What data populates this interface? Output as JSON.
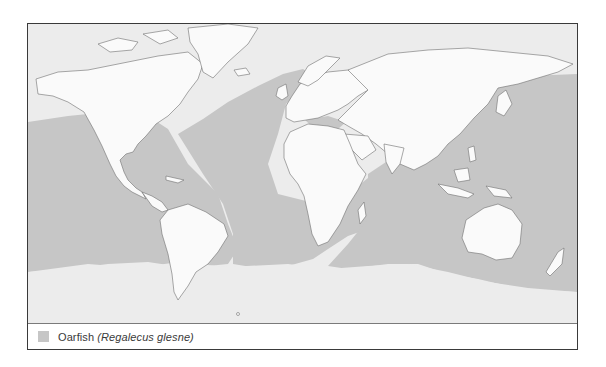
{
  "map": {
    "colors": {
      "land": "#fafafa",
      "ocean_outside_range": "#ececec",
      "species_range": "#c6c6c6",
      "coastline": "#6e6e6e",
      "border": "#3a3a3a"
    }
  },
  "legend": {
    "items": [
      {
        "common_name": "Oarfish",
        "scientific_name": "(Regalecus glesne)",
        "swatch_color": "#c6c6c6"
      }
    ]
  }
}
